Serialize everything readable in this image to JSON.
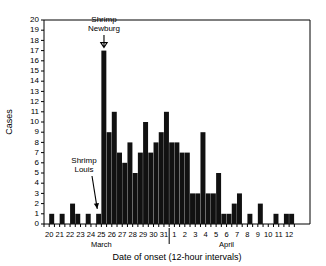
{
  "chart_data": {
    "type": "bar",
    "title": "",
    "xlabel": "Date of onset (12-hour intervals)",
    "ylabel": "Cases",
    "ylim": [
      0,
      20
    ],
    "ytick_labels": [
      "0",
      "1",
      "2",
      "3",
      "4",
      "5",
      "6",
      "7",
      "8",
      "9",
      "10",
      "11",
      "12",
      "13",
      "14",
      "15",
      "16",
      "17",
      "18",
      "19",
      "20"
    ],
    "grid": false,
    "legend": null,
    "bin_interval": "12-hour",
    "month_labels": [
      {
        "text": "March",
        "center_day": 25
      },
      {
        "text": "April",
        "center_day": 6
      }
    ],
    "day_tick_labels": [
      "20",
      "21",
      "22",
      "23",
      "24",
      "25",
      "26",
      "27",
      "28",
      "29",
      "30",
      "31",
      "1",
      "2",
      "3",
      "4",
      "5",
      "6",
      "7",
      "8",
      "9",
      "10",
      "11",
      "12"
    ],
    "categories": [
      "Mar 20 AM",
      "Mar 20 PM",
      "Mar 21 AM",
      "Mar 21 PM",
      "Mar 22 AM",
      "Mar 22 PM",
      "Mar 23 AM",
      "Mar 23 PM",
      "Mar 24 AM",
      "Mar 24 PM",
      "Mar 25 AM",
      "Mar 25 PM",
      "Mar 26 AM",
      "Mar 26 PM",
      "Mar 27 AM",
      "Mar 27 PM",
      "Mar 28 AM",
      "Mar 28 PM",
      "Mar 29 AM",
      "Mar 29 PM",
      "Mar 30 AM",
      "Mar 30 PM",
      "Mar 31 AM",
      "Mar 31 PM",
      "Apr 1 AM",
      "Apr 1 PM",
      "Apr 2 AM",
      "Apr 2 PM",
      "Apr 3 AM",
      "Apr 3 PM",
      "Apr 4 AM",
      "Apr 4 PM",
      "Apr 5 AM",
      "Apr 5 PM",
      "Apr 6 AM",
      "Apr 6 PM",
      "Apr 7 AM",
      "Apr 7 PM",
      "Apr 8 AM",
      "Apr 8 PM",
      "Apr 9 AM",
      "Apr 9 PM",
      "Apr 10 AM",
      "Apr 10 PM",
      "Apr 11 AM",
      "Apr 11 PM",
      "Apr 12 AM",
      "Apr 12 PM"
    ],
    "values": [
      0,
      1,
      0,
      1,
      0,
      2,
      1,
      0,
      1,
      0,
      1,
      17,
      9,
      11,
      7,
      6,
      8,
      5,
      7,
      10,
      7,
      8,
      9,
      11,
      8,
      8,
      7,
      7,
      3,
      3,
      9,
      3,
      3,
      5,
      1,
      1,
      2,
      3,
      0,
      1,
      0,
      2,
      0,
      0,
      1,
      0,
      1,
      1
    ]
  },
  "annotations": [
    {
      "name": "shrimp-newburg",
      "line1": "Shrimp",
      "line2": "Newburg",
      "arrow": "down-arrow"
    },
    {
      "name": "shrimp-louis",
      "line1": "Shrimp",
      "line2": "Louis",
      "arrow": "diagonal-arrow"
    }
  ]
}
